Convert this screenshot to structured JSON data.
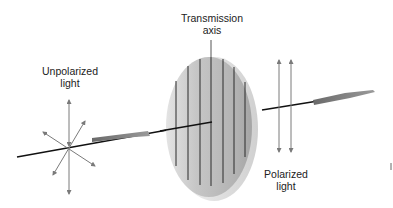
{
  "diagram": {
    "labels": {
      "transmission_axis": [
        "Transmission",
        "axis"
      ],
      "unpolarized_light": [
        "Unpolarized",
        "light"
      ],
      "polarized_light": [
        "Polarized",
        "light"
      ]
    },
    "colors": {
      "beam": "#111111",
      "arrow_gray": "#7a7a7a",
      "filter_face": "#bdbdbd",
      "filter_rim": "#e6e6e6",
      "filter_lines": "#2a2a2a"
    },
    "filter_line_count": 7,
    "unpolarized_vector_count": 4,
    "polarized_vector_count": 2
  }
}
